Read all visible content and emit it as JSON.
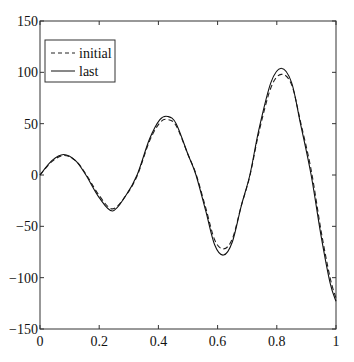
{
  "chart_data": {
    "type": "line",
    "title": "",
    "xlabel": "",
    "ylabel": "",
    "xlim": [
      0,
      1
    ],
    "ylim": [
      -150,
      150
    ],
    "grid": false,
    "legend_position": "top-left",
    "x_ticks": [
      0,
      0.2,
      0.4,
      0.6,
      0.8,
      1
    ],
    "x_tick_labels": [
      "0",
      "0.2",
      "0.4",
      "0.6",
      "0.8",
      "1"
    ],
    "y_ticks": [
      -150,
      -100,
      -50,
      0,
      50,
      100,
      150
    ],
    "y_tick_labels": [
      "−150",
      "−100",
      "−50",
      "0",
      "50",
      "100",
      "150"
    ],
    "series": [
      {
        "name": "initial",
        "style": "dashed",
        "color": "#222222",
        "x": [
          0,
          0.04,
          0.08,
          0.12,
          0.155,
          0.2,
          0.245,
          0.29,
          0.328,
          0.37,
          0.405,
          0.432,
          0.46,
          0.5,
          0.527,
          0.56,
          0.59,
          0.62,
          0.65,
          0.68,
          0.709,
          0.74,
          0.78,
          0.815,
          0.85,
          0.88,
          0.916,
          0.95,
          0.98,
          1.0
        ],
        "y": [
          0,
          13,
          19,
          14,
          1,
          -20,
          -33,
          -20,
          -1,
          33,
          51,
          54,
          48,
          20,
          1,
          -32,
          -63,
          -72,
          -62,
          -30,
          -1,
          42,
          85,
          98,
          88,
          52,
          5,
          -55,
          -100,
          -120
        ]
      },
      {
        "name": "last",
        "style": "solid",
        "color": "#111111",
        "x": [
          0,
          0.04,
          0.08,
          0.12,
          0.155,
          0.2,
          0.245,
          0.29,
          0.328,
          0.37,
          0.405,
          0.432,
          0.46,
          0.5,
          0.527,
          0.56,
          0.59,
          0.62,
          0.65,
          0.68,
          0.709,
          0.74,
          0.78,
          0.815,
          0.85,
          0.88,
          0.916,
          0.95,
          0.98,
          1.0
        ],
        "y": [
          0,
          14,
          20,
          14,
          0,
          -22,
          -35,
          -20,
          0,
          35,
          54,
          57,
          50,
          20,
          0,
          -35,
          -68,
          -78,
          -65,
          -30,
          0,
          45,
          90,
          104,
          90,
          50,
          0,
          -60,
          -105,
          -123
        ]
      }
    ]
  }
}
